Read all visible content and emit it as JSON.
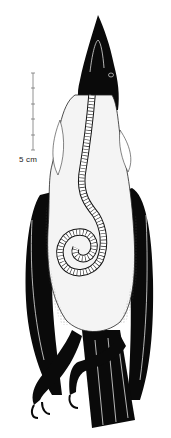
{
  "figure": {
    "scale_bar": {
      "label": "5 cm",
      "ticks": 5
    },
    "colors": {
      "ink": "#0a0a0a",
      "paper": "#ffffff",
      "organ_fill": "#f4f4f4"
    }
  }
}
